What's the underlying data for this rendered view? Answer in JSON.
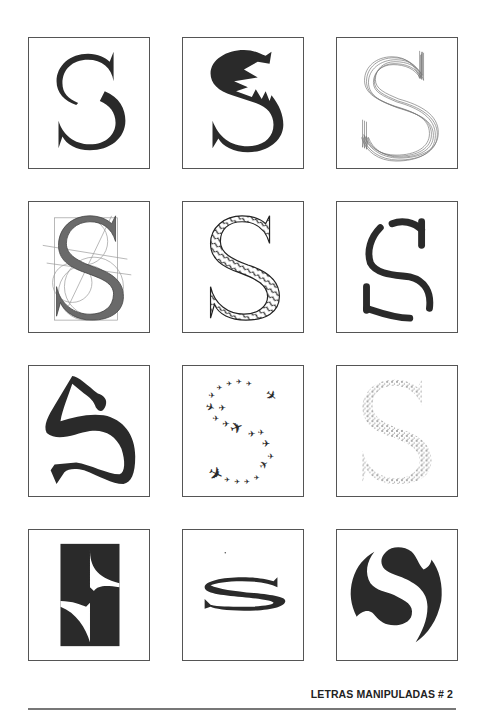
{
  "page": {
    "footer_title": "LETRAS MANIPULADAS # 2"
  },
  "colors": {
    "ink": "#2a2a2a",
    "border": "#555555",
    "sketch": "#777777",
    "rule": "#777777"
  },
  "grid": {
    "columns": 3,
    "rows": 4,
    "tiles": [
      {
        "index": 1,
        "variant": "split-s",
        "description": "Serif S cut in halves, offset"
      },
      {
        "index": 2,
        "variant": "jagged-s",
        "description": "S with torn zigzag interior edge"
      },
      {
        "index": 3,
        "variant": "multi-outline-s",
        "description": "S traced with many overlapping outlines"
      },
      {
        "index": 4,
        "variant": "construction-s",
        "description": "S with geometric construction circles and lines"
      },
      {
        "index": 5,
        "variant": "scribble-fill-s",
        "description": "S outline filled with scribbles"
      },
      {
        "index": 6,
        "variant": "skeleton-s",
        "description": "S drawn with thick rounded stroke segments"
      },
      {
        "index": 7,
        "variant": "brush-s",
        "description": "Distorted brush-style S"
      },
      {
        "index": 8,
        "variant": "airplanes-s",
        "description": "S formed by a flock of airplanes"
      },
      {
        "index": 9,
        "variant": "stipple-s",
        "description": "S rendered in stipple dots"
      },
      {
        "index": 10,
        "variant": "negative-space-s",
        "description": "S as white cuts in a black rectangle"
      },
      {
        "index": 11,
        "variant": "flattened-s",
        "description": "S squashed vertically into ellipse"
      },
      {
        "index": 12,
        "variant": "circle-s",
        "description": "S carved from a black circle"
      }
    ]
  }
}
